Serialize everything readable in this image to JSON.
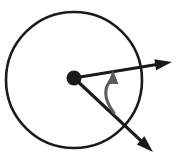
{
  "figure": {
    "title": "",
    "background_color": "#ffffff",
    "width": 178,
    "height": 158
  },
  "colors": {
    "stroke_dark": "#1a1a1a",
    "stroke_gray": "#5c5c5c",
    "background": "#ffffff"
  },
  "circle": {
    "label": "circle",
    "center_x": 74,
    "center_y": 80,
    "radius": 68,
    "stroke_width": 2.6,
    "stroke_color": "#1a1a1a",
    "fill": "none"
  },
  "center_point": {
    "label": "center-point",
    "x": 74,
    "y": 78,
    "radius": 7.5,
    "fill": "#1a1a1a"
  },
  "arrows": [
    {
      "name": "upper-right-arrow",
      "label": "upper right arrow",
      "from_x": 74,
      "from_y": 78,
      "to_x": 172,
      "to_y": 62,
      "stroke_width": 3.2,
      "stroke_color": "#1a1a1a",
      "head_length": 17,
      "head_width": 11
    },
    {
      "name": "lower-right-arrow",
      "label": "lower right arrow",
      "from_x": 74,
      "from_y": 78,
      "to_x": 153,
      "to_y": 152,
      "stroke_width": 3.2,
      "stroke_color": "#1a1a1a",
      "head_length": 17,
      "head_width": 11
    }
  ],
  "angle_arc": {
    "name": "angle-arc-arrow",
    "label": "curved angle arrow",
    "start_x": 114,
    "start_y": 113,
    "control_x": 98,
    "control_y": 92,
    "end_x": 113,
    "end_y": 70,
    "stroke_width": 3.0,
    "stroke_color": "#5c5c5c",
    "head_length": 14,
    "head_width": 11,
    "direction": "counterclockwise-upward"
  }
}
